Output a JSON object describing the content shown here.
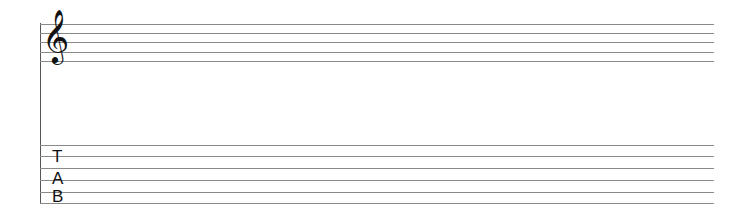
{
  "staff": {
    "clef": "𝄞",
    "clef_icon": "treble-clef-icon",
    "line_positions": [
      24,
      33,
      42,
      52,
      61
    ]
  },
  "tablature": {
    "letters": [
      "T",
      "A",
      "B"
    ],
    "line_positions": [
      145,
      156,
      168,
      180,
      192,
      203
    ]
  },
  "colors": {
    "lines": "#8a8a8a",
    "bar": "#555555",
    "glyphs": "#111111"
  }
}
